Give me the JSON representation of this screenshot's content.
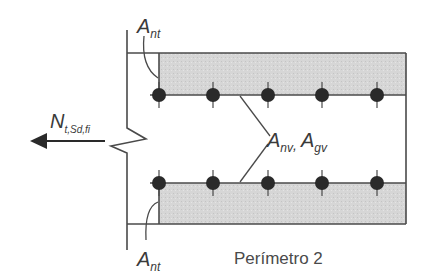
{
  "diagram": {
    "caption": "Perímetro 2",
    "labels": {
      "ant_top": {
        "main": "A",
        "sub": "nt"
      },
      "ant_bottom": {
        "main": "A",
        "sub": "nt"
      },
      "anv": {
        "main": "A",
        "sub": "nv",
        "sep": ","
      },
      "agv": {
        "main": "A",
        "sub": "gv"
      },
      "force": {
        "main": "N",
        "sub": "t,Sd,fi"
      }
    },
    "bolts_per_row": 5,
    "rows": 2,
    "colors": {
      "line": "#4a4a4a",
      "shaded_area": "#d9d9d9",
      "bolt": "#2a2a2a",
      "arrow": "#2a2a2a",
      "text": "#3a3a3a"
    }
  }
}
